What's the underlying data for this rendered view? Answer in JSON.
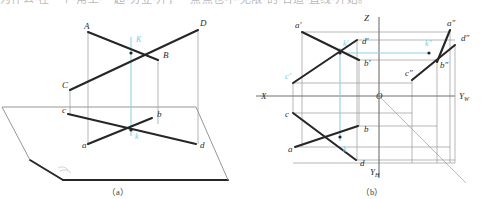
{
  "page": {
    "width": 481,
    "height": 199,
    "background": "#ffffff",
    "cropped_header_text": "为什么·在一个·角上·一起·分立·开，一点点也不·无限·的·合适·直线·开始。"
  },
  "colors": {
    "line_thick": "#262626",
    "line_thin": "#9a9a9a",
    "axis": "#6e6e6e",
    "highlight_blue": "#8ed0e8",
    "label": "#2b2b2b"
  },
  "figures": [
    {
      "id": "figure-a",
      "caption": "（a）",
      "type": "pictorial-axonometric",
      "description": "Two crossing lines AB and CD in space above the horizontal plane H, with their horizontal projections ab and cd; the crossing point K with projection k.",
      "plane_label": "H",
      "labels": [
        {
          "name": "A",
          "text": "A",
          "x": 84,
          "y": 29
        },
        {
          "name": "D",
          "text": "D",
          "x": 200,
          "y": 26
        },
        {
          "name": "B",
          "text": "B",
          "x": 163,
          "y": 58
        },
        {
          "name": "C",
          "text": "C",
          "x": 62,
          "y": 88
        },
        {
          "name": "K",
          "text": "K",
          "x": 136,
          "y": 42
        },
        {
          "name": "c",
          "text": "c",
          "x": 62,
          "y": 113
        },
        {
          "name": "b",
          "text": "b",
          "x": 157,
          "y": 117
        },
        {
          "name": "a",
          "text": "a",
          "x": 82,
          "y": 148
        },
        {
          "name": "d",
          "text": "d",
          "x": 200,
          "y": 148
        },
        {
          "name": "k",
          "text": "k",
          "x": 135,
          "y": 139
        }
      ],
      "points": {
        "A": [
          88,
          32
        ],
        "B": [
          158,
          60
        ],
        "C": [
          70,
          90
        ],
        "D": [
          198,
          30
        ],
        "K": [
          131,
          53
        ],
        "a": [
          88,
          144
        ],
        "b": [
          152,
          118
        ],
        "c": [
          68,
          114
        ],
        "d": [
          196,
          144
        ],
        "k": [
          131,
          130
        ]
      }
    },
    {
      "id": "figure-b",
      "caption": "（b）",
      "type": "three-view-projection",
      "description": "Three-view (V, H, W) orthographic projection of the same two crossing lines, with 45-degree miter line from the origin O.",
      "axes": [
        {
          "name": "X",
          "text": "X",
          "x": 261,
          "y": 99
        },
        {
          "name": "Z",
          "text": "Z",
          "x": 364,
          "y": 21
        },
        {
          "name": "O",
          "text": "O",
          "x": 376,
          "y": 99
        },
        {
          "name": "YW",
          "text": "Y",
          "sub": "W",
          "x": 459,
          "y": 99
        },
        {
          "name": "YH",
          "text": "Y",
          "sub": "H",
          "x": 370,
          "y": 175
        }
      ],
      "labels": [
        {
          "name": "a-prime",
          "text": "a′",
          "x": 295,
          "y": 28
        },
        {
          "name": "d-prime",
          "text": "d′",
          "x": 362,
          "y": 44
        },
        {
          "name": "k-prime",
          "text": "k′",
          "x": 343,
          "y": 46
        },
        {
          "name": "b-prime",
          "text": "b′",
          "x": 364,
          "y": 66
        },
        {
          "name": "c-prime",
          "text": "c′",
          "x": 285,
          "y": 79
        },
        {
          "name": "a-dbl",
          "text": "a″",
          "x": 447,
          "y": 26
        },
        {
          "name": "d-dbl",
          "text": "d″",
          "x": 461,
          "y": 41
        },
        {
          "name": "k-dbl",
          "text": "k″",
          "x": 425,
          "y": 46
        },
        {
          "name": "b-dbl",
          "text": "b″",
          "x": 440,
          "y": 68
        },
        {
          "name": "c-dbl",
          "text": "c″",
          "x": 405,
          "y": 76
        },
        {
          "name": "c",
          "text": "c",
          "x": 285,
          "y": 117
        },
        {
          "name": "b",
          "text": "b",
          "x": 364,
          "y": 132
        },
        {
          "name": "a",
          "text": "a",
          "x": 288,
          "y": 152
        },
        {
          "name": "d",
          "text": "d",
          "x": 360,
          "y": 166
        },
        {
          "name": "k",
          "text": "k",
          "x": 343,
          "y": 152
        }
      ],
      "points": {
        "a_prime": [
          302,
          32
        ],
        "b_prime": [
          359,
          60
        ],
        "c_prime": [
          293,
          83
        ],
        "d_prime": [
          357,
          40
        ],
        "k_prime": [
          340,
          53
        ],
        "a_dbl": [
          450,
          30
        ],
        "b_dbl": [
          437,
          62
        ],
        "c_dbl": [
          412,
          80
        ],
        "d_dbl": [
          455,
          45
        ],
        "k_dbl": [
          429,
          53
        ],
        "a": [
          295,
          147
        ],
        "b": [
          358,
          126
        ],
        "c": [
          293,
          113
        ],
        "d": [
          356,
          160
        ],
        "k": [
          340,
          137
        ]
      }
    }
  ]
}
